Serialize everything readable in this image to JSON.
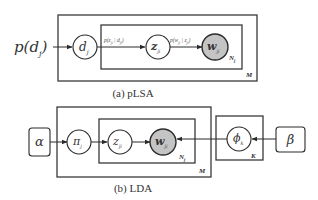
{
  "figure": {
    "panels": [
      {
        "id": "plsa",
        "caption": "(a) pLSA",
        "input_label": {
          "base": "p(d",
          "sub": "j",
          "close": ")"
        },
        "nodes": [
          {
            "id": "d",
            "symbol": "d",
            "sub": "j",
            "observed": false
          },
          {
            "id": "z",
            "symbol": "z",
            "sub": "ji",
            "observed": false
          },
          {
            "id": "w",
            "symbol": "w",
            "sub": "ji",
            "observed": true
          }
        ],
        "edge_labels": [
          {
            "from": "d",
            "to": "z",
            "text": "p(z",
            "sub1": "ji",
            "mid": " | d",
            "sub2": "ji",
            "close": ")"
          },
          {
            "from": "z",
            "to": "w",
            "text": "p(w",
            "sub1": "ji",
            "mid": " | z",
            "sub2": "ji",
            "close": ")"
          }
        ],
        "plates": [
          {
            "id": "inner",
            "label": "N",
            "sub": "j"
          },
          {
            "id": "outer",
            "label": "M"
          }
        ]
      },
      {
        "id": "lda",
        "caption": "(b) LDA",
        "hyperparameters": [
          {
            "id": "alpha",
            "symbol": "α"
          },
          {
            "id": "beta",
            "symbol": "β"
          }
        ],
        "nodes": [
          {
            "id": "pi",
            "symbol": "π",
            "sub": "j",
            "observed": false
          },
          {
            "id": "z",
            "symbol": "z",
            "sub": "ji",
            "observed": false
          },
          {
            "id": "w",
            "symbol": "w",
            "sub": "ji",
            "observed": true
          },
          {
            "id": "phi",
            "symbol": "ϕ",
            "sub": "k",
            "observed": false
          }
        ],
        "plates": [
          {
            "id": "inner",
            "label": "N",
            "sub": "j"
          },
          {
            "id": "outer",
            "label": "M"
          },
          {
            "id": "topics",
            "label": "K"
          }
        ]
      }
    ]
  },
  "colors": {
    "observed_fill": "#c4c4c4",
    "stroke": "#2a2a2a"
  }
}
